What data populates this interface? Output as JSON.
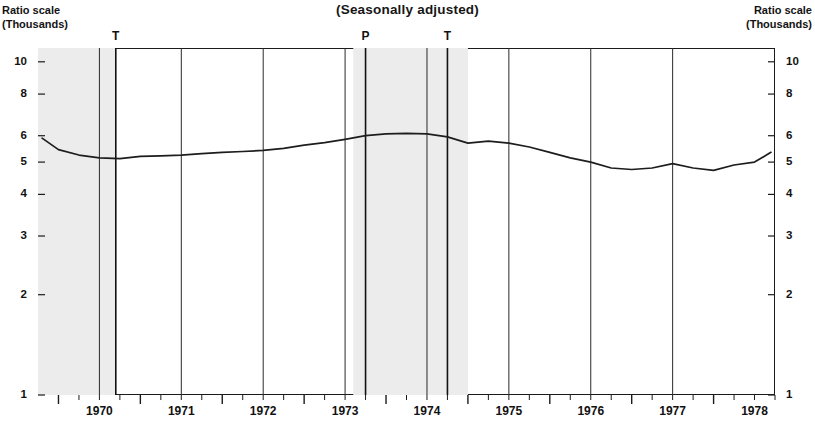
{
  "header": {
    "title": "(Seasonally adjusted)",
    "left_axis_caption_line1": "Ratio scale",
    "left_axis_caption_line2": "(Thousands)",
    "right_axis_caption_line1": "Ratio scale",
    "right_axis_caption_line2": "(Thousands)"
  },
  "chart_data": {
    "type": "line",
    "title": "(Seasonally adjusted)",
    "xlabel": "",
    "ylabel": "Ratio scale (Thousands)",
    "scale": "log",
    "grid": true,
    "legend": "none",
    "ylim": [
      1,
      11
    ],
    "xlim": [
      1969.75,
      1978.75
    ],
    "yticks": [
      1,
      2,
      3,
      4,
      5,
      6,
      8,
      10
    ],
    "ytick_labels": [
      "1",
      "2",
      "3",
      "4",
      "5",
      "6",
      "8",
      "10"
    ],
    "categories": [
      "1970",
      "1971",
      "1972",
      "1973",
      "1974",
      "1975",
      "1976",
      "1977",
      "1978"
    ],
    "xtick_labels": [
      "1970",
      "1971",
      "1972",
      "1973",
      "1974",
      "1975",
      "1976",
      "1977",
      "1978"
    ],
    "minor_ticks_per_year": 4,
    "gridlines_at": [
      "1970.5",
      "1971.5",
      "1972.5",
      "1973.5",
      "1974.5",
      "1975.5",
      "1976.5",
      "1977.5"
    ],
    "series": [
      {
        "name": "Series",
        "x": [
          1969.8,
          1970.0,
          1970.25,
          1970.5,
          1970.75,
          1971.0,
          1971.25,
          1971.5,
          1971.75,
          1972.0,
          1972.25,
          1972.5,
          1972.75,
          1973.0,
          1973.25,
          1973.5,
          1973.75,
          1974.0,
          1974.25,
          1974.5,
          1974.75,
          1975.0,
          1975.25,
          1975.5,
          1975.75,
          1976.0,
          1976.25,
          1976.5,
          1976.75,
          1977.0,
          1977.25,
          1977.5,
          1977.75,
          1978.0,
          1978.25,
          1978.5,
          1978.7
        ],
        "values": [
          5.9,
          5.45,
          5.25,
          5.15,
          5.12,
          5.2,
          5.22,
          5.25,
          5.3,
          5.35,
          5.38,
          5.42,
          5.5,
          5.62,
          5.72,
          5.85,
          6.0,
          6.08,
          6.1,
          6.08,
          5.95,
          5.7,
          5.78,
          5.7,
          5.55,
          5.35,
          5.15,
          5.0,
          4.8,
          4.75,
          4.8,
          4.95,
          4.8,
          4.72,
          4.9,
          5.0,
          5.35
        ]
      }
    ],
    "shaded_bands": [
      {
        "label": "recession",
        "from": 1969.75,
        "to": 1970.7,
        "color": "#ececec"
      },
      {
        "label": "recession",
        "from": 1973.6,
        "to": 1975.0,
        "color": "#ececec"
      }
    ],
    "markers": [
      {
        "label": "T",
        "at": 1970.7,
        "name": "trough-1970"
      },
      {
        "label": "P",
        "at": 1973.75,
        "name": "peak-1973"
      },
      {
        "label": "T",
        "at": 1974.75,
        "name": "trough-1975"
      }
    ]
  }
}
